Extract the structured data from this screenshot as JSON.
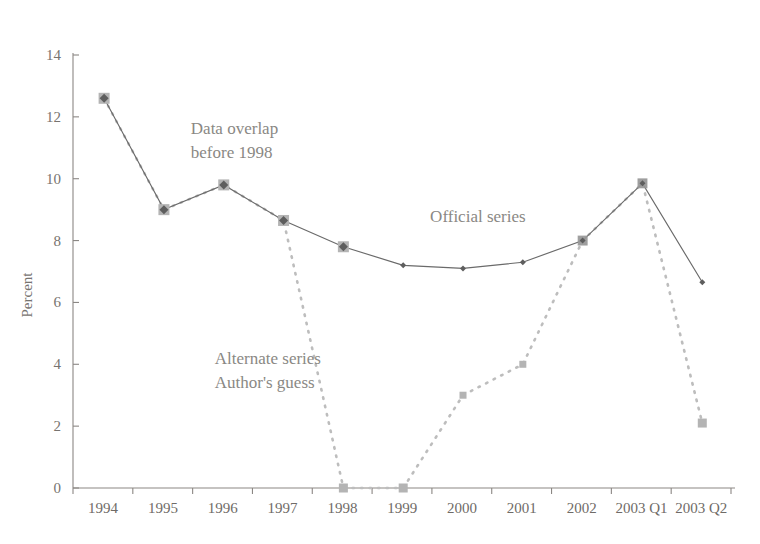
{
  "chart_data": {
    "type": "line",
    "title": "",
    "xlabel": "",
    "ylabel": "Percent",
    "ylim": [
      0,
      14
    ],
    "yticks": [
      0,
      2,
      4,
      6,
      8,
      10,
      12,
      14
    ],
    "ytick_labels": [
      "0",
      "2",
      "4",
      "6",
      "8",
      "10",
      "12",
      "14"
    ],
    "grid": false,
    "legend_position": "inline-annotations",
    "categories": [
      "1994",
      "1995",
      "1996",
      "1997",
      "1998",
      "1999",
      "2000",
      "2001",
      "2002",
      "2003 Q1",
      "2003 Q2"
    ],
    "series": [
      {
        "name": "Official series",
        "style": "solid",
        "color": "#5e5e5e",
        "values": [
          12.6,
          9.0,
          9.8,
          8.65,
          7.8,
          7.2,
          7.1,
          7.3,
          8.0,
          9.85,
          6.65
        ]
      },
      {
        "name": "Alternate series Author's guess",
        "style": "dotted",
        "color": "#b4b4b4",
        "values": [
          12.6,
          9.0,
          9.8,
          8.65,
          0.0,
          0.0,
          3.0,
          4.0,
          8.0,
          9.85,
          2.1
        ]
      }
    ],
    "annotations": [
      {
        "id": "data-overlap",
        "lines": [
          "Data overlap",
          "before 1998"
        ],
        "x_value": 1.45,
        "y_value": 11.45
      },
      {
        "id": "official-series",
        "lines": [
          "Official series"
        ],
        "x_value": 5.45,
        "y_value": 8.6
      },
      {
        "id": "alternate-series",
        "lines": [
          "Alternate series",
          "Author's guess"
        ],
        "x_value": 1.85,
        "y_value": 4.0
      }
    ],
    "marker_large_indices": [
      0,
      1,
      2,
      3,
      4,
      5,
      8,
      9,
      10
    ],
    "colors": {
      "official": "#5e5e5e",
      "alternate": "#b4b4b4",
      "axis": "#8b8784",
      "text": "#77736f",
      "annotation": "#8a8884",
      "background": "#ffffff"
    }
  }
}
